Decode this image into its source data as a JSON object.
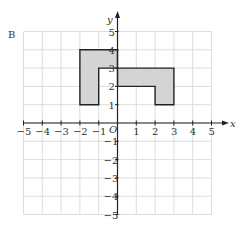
{
  "figure_label": "B",
  "axes": {
    "x_label": "x",
    "y_label": "y",
    "origin_label": "O",
    "x_ticks": [
      "−5",
      "−4",
      "−3",
      "−2",
      "−1",
      "1",
      "2",
      "3",
      "4",
      "5"
    ],
    "y_ticks": [
      "5",
      "4",
      "3",
      "2",
      "1",
      "−1",
      "−2",
      "−3",
      "−4",
      "−5"
    ],
    "range": [
      -5,
      5
    ]
  },
  "shapes": [
    {
      "name": "left-shape",
      "vertices": [
        [
          -2,
          1
        ],
        [
          -2,
          4
        ],
        [
          0,
          4
        ],
        [
          0,
          3
        ],
        [
          -1,
          3
        ],
        [
          -1,
          1
        ]
      ],
      "fill": "#d4d4d4"
    },
    {
      "name": "right-shape",
      "vertices": [
        [
          0,
          3
        ],
        [
          3,
          3
        ],
        [
          3,
          1
        ],
        [
          2,
          1
        ],
        [
          2,
          2
        ],
        [
          0,
          2
        ]
      ],
      "fill": "#d4d4d4"
    }
  ],
  "colors": {
    "grid": "#dddddd",
    "axis": "#222222",
    "outline": "#222222",
    "fill": "#d4d4d4"
  }
}
